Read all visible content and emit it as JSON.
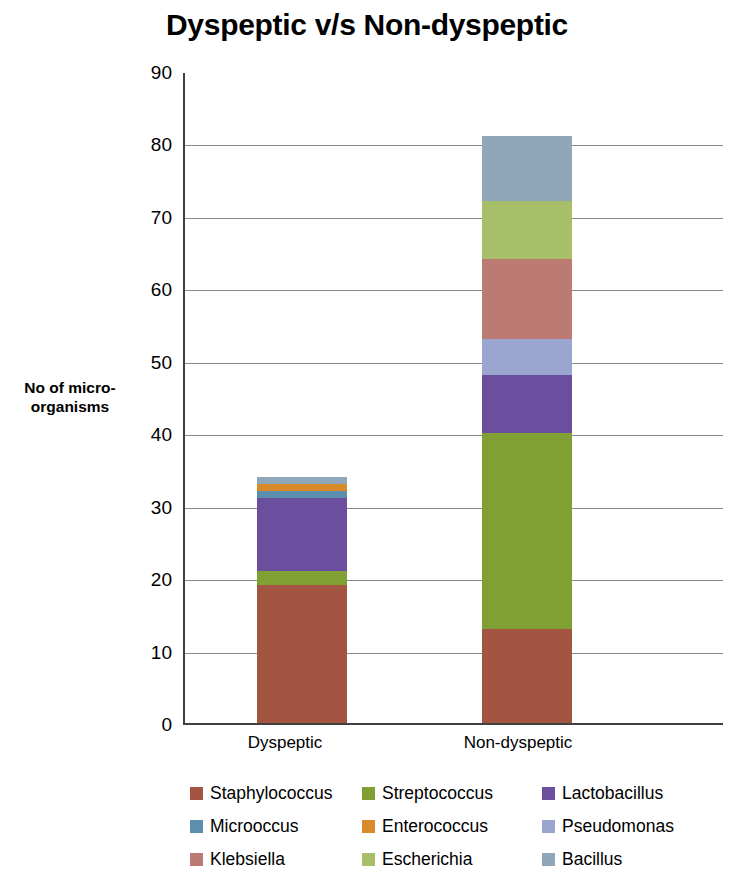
{
  "chart_data": {
    "type": "bar",
    "subtype": "stacked",
    "title": "Dyspeptic v/s Non-dyspeptic",
    "xlabel": "",
    "ylabel": "No of micro-organisms",
    "ylim": [
      0,
      90
    ],
    "ytick_step": 10,
    "yticks": [
      90,
      80,
      70,
      60,
      50,
      40,
      30,
      20,
      10,
      0
    ],
    "grid": true,
    "legend_position": "bottom",
    "categories": [
      "Dyspeptic",
      "Non-dyspeptic"
    ],
    "series": [
      {
        "name": "Staphylococcus",
        "color": "#a35541",
        "values": [
          19,
          13
        ]
      },
      {
        "name": "Streptococcus",
        "color": "#80a033",
        "values": [
          2,
          27
        ]
      },
      {
        "name": "Lactobacillus",
        "color": "#6c4e9e",
        "values": [
          10,
          8
        ]
      },
      {
        "name": "Microoccus",
        "color": "#5b8fad",
        "values": [
          1,
          0
        ]
      },
      {
        "name": "Enterococcus",
        "color": "#d98b2b",
        "values": [
          1,
          0
        ]
      },
      {
        "name": "Pseudomonas",
        "color": "#9aa6d0",
        "values": [
          0,
          5
        ]
      },
      {
        "name": "Klebsiella",
        "color": "#bb7a72",
        "values": [
          0,
          11
        ]
      },
      {
        "name": "Escherichia",
        "color": "#a8bf6a",
        "values": [
          0,
          8
        ]
      },
      {
        "name": "Bacillus",
        "color": "#8fa7b8",
        "values": [
          1,
          9
        ]
      }
    ],
    "totals": [
      34,
      81
    ]
  },
  "y_axis": {
    "caption_line1": "No of micro-",
    "caption_line2": "organisms"
  },
  "legend": {
    "rows": [
      [
        {
          "label": "Staphylococcus",
          "color": "#a35541"
        },
        {
          "label": "Streptococcus",
          "color": "#80a033"
        },
        {
          "label": "Lactobacillus",
          "color": "#6c4e9e"
        }
      ],
      [
        {
          "label": "Microoccus",
          "color": "#5b8fad"
        },
        {
          "label": "Enterococcus",
          "color": "#d98b2b"
        },
        {
          "label": "Pseudomonas",
          "color": "#9aa6d0"
        }
      ],
      [
        {
          "label": "Klebsiella",
          "color": "#bb7a72"
        },
        {
          "label": "Escherichia",
          "color": "#a8bf6a"
        },
        {
          "label": "Bacillus",
          "color": "#8fa7b8"
        }
      ]
    ]
  }
}
